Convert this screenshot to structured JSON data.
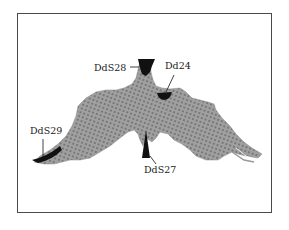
{
  "figure": {
    "colors": {
      "frame": "#4a4a4a",
      "lattice_fill": "#9a9a9a",
      "lattice_dot": "#6e6e6e",
      "marker": "#111111",
      "background": "#ffffff"
    },
    "labels": [
      {
        "id": "DdS28",
        "text": "DdS28"
      },
      {
        "id": "Dd24",
        "text": "Dd24"
      },
      {
        "id": "DdS29",
        "text": "DdS29"
      },
      {
        "id": "DdS27",
        "text": "DdS27"
      }
    ]
  }
}
